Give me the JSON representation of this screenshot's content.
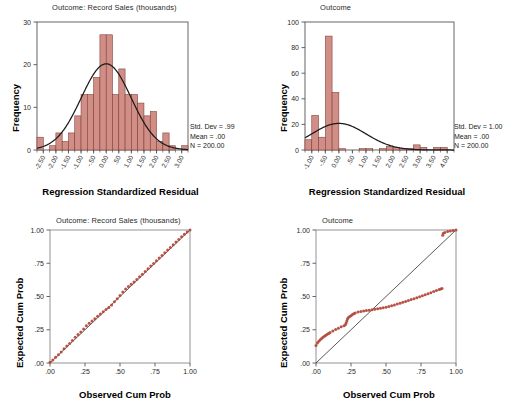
{
  "figure": {
    "panels": [
      {
        "id": "hist-left",
        "title": "Outcome: Record Sales (thousands)",
        "xlabel": "Regression Standardized Residual",
        "ylabel": "Frequency",
        "stats": {
          "std_dev": "Std. Dev = .99",
          "mean": "Mean = .00",
          "n": "N = 200.00"
        }
      },
      {
        "id": "hist-right",
        "title": "Outcome",
        "xlabel": "Regression Standardized Residual",
        "ylabel": "Frequency",
        "stats": {
          "std_dev": "Std. Dev = 1.00",
          "mean": "Mean = .00",
          "n": "N = 200.00"
        }
      },
      {
        "id": "pp-left",
        "title": "Outcome: Record Sales (thousands)",
        "xlabel": "Observed Cum Prob",
        "ylabel": "Expected Cum Prob"
      },
      {
        "id": "pp-right",
        "title": "Outcome",
        "xlabel": "Observed Cum Prob",
        "ylabel": "Expected Cum Prob"
      }
    ]
  },
  "colors": {
    "bar_fill": "#D08E86",
    "bar_stroke": "#7a3b33",
    "point": "#B44a3c",
    "axis": "#555555",
    "curve": "#1a1a1a"
  },
  "chart_data": [
    {
      "type": "bar",
      "id": "hist-left",
      "title": "Outcome: Record Sales (thousands)",
      "xlabel": "Regression Standardized Residual",
      "ylabel": "Frequency",
      "xlim": [
        -2.75,
        3.25
      ],
      "ylim": [
        0,
        30
      ],
      "yticks": [
        0,
        10,
        20,
        30
      ],
      "ytick_labels": [
        "0",
        "10",
        "20",
        "30"
      ],
      "xticks": [
        -2.5,
        -2.0,
        -1.5,
        -1.0,
        -0.5,
        0.0,
        0.5,
        1.0,
        1.5,
        2.0,
        2.5,
        3.0
      ],
      "xtick_labels": [
        "-2.50",
        "-2.00",
        "-1.50",
        "-1.00",
        "-.50",
        "0.00",
        ".50",
        "1.00",
        "1.50",
        "2.00",
        "2.50",
        "3.00"
      ],
      "bin_width": 0.25,
      "bin_centers": [
        -2.625,
        -2.375,
        -2.125,
        -1.875,
        -1.625,
        -1.375,
        -1.125,
        -0.875,
        -0.625,
        -0.375,
        -0.125,
        0.125,
        0.375,
        0.625,
        0.875,
        1.125,
        1.375,
        1.625,
        1.875,
        2.125,
        2.375,
        2.625,
        2.875,
        3.125
      ],
      "values": [
        3,
        0,
        1,
        4,
        2,
        4,
        8,
        13,
        13,
        17,
        27,
        27,
        13,
        19,
        13,
        13,
        11,
        8,
        9,
        2,
        4,
        1,
        0,
        1
      ],
      "normal_curve": {
        "mean": 0.0,
        "std_dev": 0.99,
        "n": 200,
        "peak": 20.2
      },
      "grid": false,
      "legend": null,
      "annotations": [
        "Std. Dev = .99",
        "Mean = .00",
        "N = 200.00"
      ]
    },
    {
      "type": "bar",
      "id": "hist-right",
      "title": "Outcome",
      "xlabel": "Regression Standardized Residual",
      "ylabel": "Frequency",
      "xlim": [
        -1.25,
        4.25
      ],
      "ylim": [
        0,
        100
      ],
      "yticks": [
        0,
        20,
        40,
        60,
        80,
        100
      ],
      "ytick_labels": [
        "0",
        "20",
        "40",
        "60",
        "80",
        "100"
      ],
      "xticks": [
        -1.0,
        -0.5,
        0.0,
        0.5,
        1.0,
        1.5,
        2.0,
        2.5,
        3.0,
        3.5,
        4.0
      ],
      "xtick_labels": [
        "-1.00",
        "-.50",
        "0.00",
        ".50",
        "1.00",
        "1.50",
        "2.00",
        "2.50",
        "3.00",
        "3.50",
        "4.00"
      ],
      "bin_width": 0.25,
      "bin_centers": [
        -1.125,
        -0.875,
        -0.625,
        -0.375,
        -0.125,
        0.125,
        0.375,
        0.625,
        0.875,
        1.125,
        1.375,
        1.625,
        1.875,
        2.125,
        2.375,
        2.625,
        2.875,
        3.125,
        3.375,
        3.625,
        3.875,
        4.125
      ],
      "values": [
        8,
        27,
        10,
        89,
        45,
        1,
        0,
        0,
        1,
        1,
        0,
        1,
        3,
        2,
        1,
        1,
        4,
        2,
        0,
        2,
        2,
        0
      ],
      "normal_curve": {
        "mean": 0.0,
        "std_dev": 1.0,
        "n": 200,
        "peak": 20.8
      },
      "grid": false,
      "legend": null,
      "annotations": [
        "Std. Dev = 1.00",
        "Mean = .00",
        "N = 200.00"
      ]
    },
    {
      "type": "scatter",
      "id": "pp-left",
      "title": "Outcome: Record Sales (thousands)",
      "xlabel": "Observed Cum Prob",
      "ylabel": "Expected Cum Prob",
      "xlim": [
        0,
        1
      ],
      "ylim": [
        0,
        1
      ],
      "xticks": [
        0.0,
        0.25,
        0.5,
        0.75,
        1.0
      ],
      "xtick_labels": [
        ".00",
        ".25",
        ".50",
        ".75",
        "1.00"
      ],
      "yticks": [
        0.0,
        0.25,
        0.5,
        0.75,
        1.0
      ],
      "ytick_labels": [
        ".00",
        ".25",
        ".50",
        ".75",
        "1.00"
      ],
      "reference_line": [
        [
          0,
          0
        ],
        [
          1,
          1
        ]
      ],
      "points_x": [
        0.0,
        0.02,
        0.04,
        0.06,
        0.08,
        0.1,
        0.12,
        0.14,
        0.16,
        0.18,
        0.2,
        0.22,
        0.24,
        0.26,
        0.28,
        0.3,
        0.32,
        0.34,
        0.36,
        0.38,
        0.4,
        0.42,
        0.44,
        0.46,
        0.48,
        0.5,
        0.52,
        0.54,
        0.56,
        0.58,
        0.6,
        0.62,
        0.64,
        0.66,
        0.68,
        0.7,
        0.72,
        0.74,
        0.76,
        0.78,
        0.8,
        0.82,
        0.84,
        0.86,
        0.88,
        0.9,
        0.92,
        0.94,
        0.96,
        0.98,
        1.0
      ],
      "points_y": [
        0.005,
        0.022,
        0.043,
        0.062,
        0.083,
        0.107,
        0.128,
        0.147,
        0.17,
        0.193,
        0.215,
        0.233,
        0.256,
        0.281,
        0.298,
        0.315,
        0.333,
        0.352,
        0.368,
        0.385,
        0.402,
        0.418,
        0.437,
        0.46,
        0.484,
        0.508,
        0.533,
        0.556,
        0.576,
        0.592,
        0.609,
        0.628,
        0.648,
        0.668,
        0.688,
        0.709,
        0.729,
        0.749,
        0.769,
        0.789,
        0.809,
        0.829,
        0.849,
        0.869,
        0.889,
        0.909,
        0.929,
        0.949,
        0.968,
        0.985,
        1.0
      ],
      "grid": false
    },
    {
      "type": "scatter",
      "id": "pp-right",
      "title": "Outcome",
      "xlabel": "Observed Cum Prob",
      "ylabel": "Expected Cum Prob",
      "xlim": [
        0,
        1
      ],
      "ylim": [
        0,
        1
      ],
      "xticks": [
        0.0,
        0.25,
        0.5,
        0.75,
        1.0
      ],
      "xtick_labels": [
        ".00",
        ".25",
        ".50",
        ".75",
        "1.00"
      ],
      "yticks": [
        0.0,
        0.25,
        0.5,
        0.75,
        1.0
      ],
      "ytick_labels": [
        ".00",
        ".25",
        ".50",
        ".75",
        "1.00"
      ],
      "reference_line": [
        [
          0,
          0
        ],
        [
          1,
          1
        ]
      ],
      "points_x": [
        0.0,
        0.01,
        0.02,
        0.03,
        0.04,
        0.05,
        0.06,
        0.07,
        0.08,
        0.09,
        0.1,
        0.12,
        0.14,
        0.16,
        0.18,
        0.2,
        0.21,
        0.215,
        0.22,
        0.225,
        0.23,
        0.24,
        0.25,
        0.26,
        0.27,
        0.28,
        0.3,
        0.32,
        0.34,
        0.36,
        0.38,
        0.4,
        0.42,
        0.44,
        0.46,
        0.48,
        0.5,
        0.52,
        0.54,
        0.56,
        0.58,
        0.6,
        0.62,
        0.64,
        0.66,
        0.68,
        0.7,
        0.72,
        0.74,
        0.76,
        0.78,
        0.8,
        0.82,
        0.84,
        0.86,
        0.88,
        0.89,
        0.9,
        0.905,
        0.91,
        0.92,
        0.94,
        0.96,
        0.98,
        1.0
      ],
      "points_y": [
        0.132,
        0.15,
        0.163,
        0.174,
        0.184,
        0.193,
        0.201,
        0.209,
        0.216,
        0.222,
        0.229,
        0.241,
        0.252,
        0.262,
        0.272,
        0.281,
        0.288,
        0.3,
        0.316,
        0.33,
        0.341,
        0.35,
        0.356,
        0.364,
        0.37,
        0.376,
        0.383,
        0.388,
        0.391,
        0.394,
        0.397,
        0.4,
        0.404,
        0.408,
        0.412,
        0.416,
        0.42,
        0.425,
        0.431,
        0.437,
        0.443,
        0.449,
        0.456,
        0.463,
        0.47,
        0.477,
        0.484,
        0.491,
        0.498,
        0.505,
        0.513,
        0.521,
        0.529,
        0.537,
        0.545,
        0.553,
        0.556,
        0.56,
        0.96,
        0.975,
        0.982,
        0.988,
        0.993,
        0.997,
        1.0
      ],
      "grid": false
    }
  ]
}
